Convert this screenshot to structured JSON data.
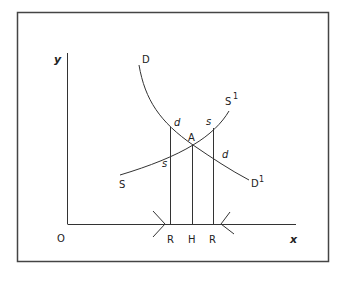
{
  "diagram": {
    "axes": {
      "y_label": "y",
      "x_label": "x",
      "origin_label": "O"
    },
    "curves": {
      "demand": {
        "start_label": "D",
        "end_label": "D",
        "end_superscript": "1"
      },
      "supply": {
        "start_label": "S",
        "end_label": "S",
        "end_superscript": "1"
      }
    },
    "point_labels": {
      "equilibrium": "A",
      "d_upper": "d",
      "d_lower": "d",
      "s_upper": "s",
      "s_lower": "s"
    },
    "x_axis_labels": [
      "R",
      "H",
      "R"
    ],
    "colors": {
      "line": "#333333",
      "frame": "#444444",
      "background": "#ffffff"
    }
  }
}
